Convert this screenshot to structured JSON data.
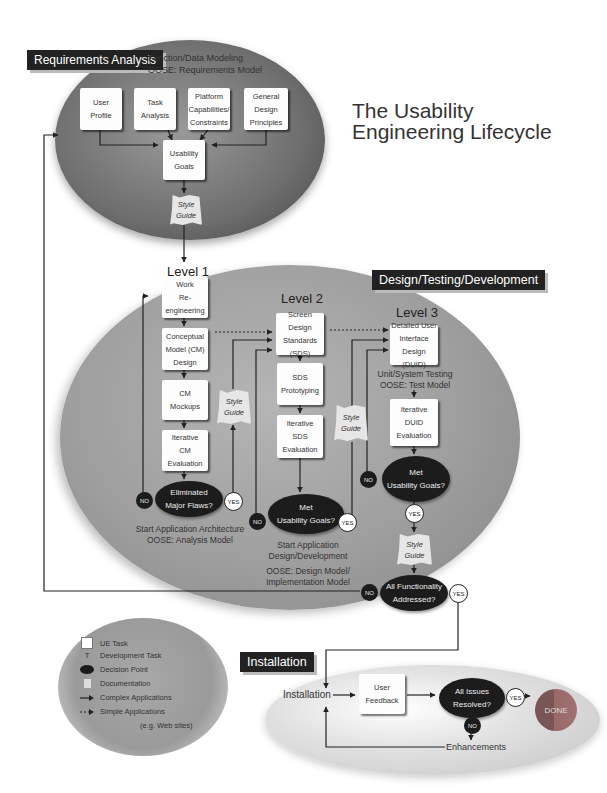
{
  "title": "The Usability\nEngineering Lifecycle",
  "phases": {
    "requirements": {
      "banner": "Requirements Analysis",
      "note": "Function/Data Modeling\nOOSE: Requirements Model",
      "tasks": [
        {
          "label": "User\nProfile"
        },
        {
          "label": "Task\nAnalysis"
        },
        {
          "label": "Platform\nCapabilities/\nConstraints"
        },
        {
          "label": "General\nDesign\nPrinciples"
        }
      ],
      "goals": "Usability\nGoals",
      "style_guide": "Style\nGuide"
    },
    "design": {
      "banner": "Design/Testing/Development",
      "level1": {
        "label": "Level 1",
        "tasks": [
          {
            "label": "Work\nRe-\nengineering"
          },
          {
            "label": "Conceptual\nModel (CM)\nDesign"
          },
          {
            "label": "CM\nMockups"
          },
          {
            "label": "Iterative\nCM\nEvaluation"
          }
        ],
        "decision": "Eliminated\nMajor Flaws?",
        "style_guide": "Style\nGuide",
        "note": "Start Application Architecture\nOOSE: Analysis Model",
        "yes": "YES",
        "no": "NO"
      },
      "level2": {
        "label": "Level 2",
        "tasks": [
          {
            "label": "Screen Design\nStandards\n(SDS)"
          },
          {
            "label": "SDS\nPrototyping"
          },
          {
            "label": "Iterative\nSDS\nEvaluation"
          }
        ],
        "decision": "Met\nUsability Goals?",
        "style_guide": "Style\nGuide",
        "note": "Start Application\nDesign/Development",
        "note2": "OOSE: Design Model/\nImplementation Model",
        "yes": "YES",
        "no": "NO"
      },
      "level3": {
        "label": "Level 3",
        "tasks": [
          {
            "label": "Detailed User\nInterface\nDesign (DUID)"
          },
          {
            "label": "Iterative\nDUID\nEvaluation"
          }
        ],
        "note": "Unit/System Testing\nOOSE: Test Model",
        "decision": "Met\nUsability Goals?",
        "style_guide": "Style\nGuide",
        "yes": "YES",
        "no": "NO"
      },
      "final_decision": "All Functionality\nAddressed?",
      "final_yes": "YES",
      "final_no": "NO"
    },
    "installation": {
      "banner": "Installation",
      "start": "Installation",
      "feedback": "User\nFeedback",
      "decision": "All Issues\nResolved?",
      "yes": "YES",
      "no": "NO",
      "done": "DONE",
      "enhancements": "Enhancements"
    }
  },
  "legend": [
    {
      "icon": "ue-task-icon",
      "label": "UE Task"
    },
    {
      "icon": "development-task-icon",
      "glyph": "T",
      "label": "Development Task"
    },
    {
      "icon": "decision-point-icon",
      "label": "Decision Point"
    },
    {
      "icon": "documentation-icon",
      "label": "Documentation"
    },
    {
      "icon": "solid-arrow-icon",
      "label": "Complex Applications"
    },
    {
      "icon": "dotted-arrow-icon",
      "label": "Simple Applications"
    },
    {
      "icon": "",
      "label": "(e.g. Web sites)"
    }
  ]
}
